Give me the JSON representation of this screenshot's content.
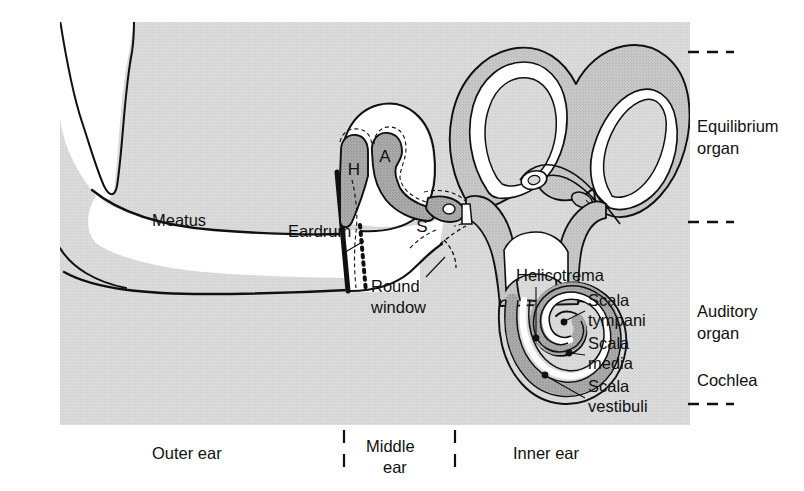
{
  "figure": {
    "background_color": "#ffffff",
    "panel_color": "#d9d9d9",
    "tissue_dark_color": "#a8a8a8",
    "tissue_mid_color": "#c4c4c4",
    "lumen_color": "#ffffff",
    "outline_color": "#101010"
  },
  "labels": {
    "meatus": "Meatus",
    "eardrum": "Eardrum",
    "round_window_line1": "Round",
    "round_window_line2": "window",
    "helicotrema": "Helicotrema",
    "scala_tympani_line1": "Scala",
    "scala_tympani_line2": "tympani",
    "scala_media_line1": "Scala",
    "scala_media_line2": "media",
    "scala_vestibuli_line1": "Scala",
    "scala_vestibuli_line2": "vestibuli",
    "ossicle_hammer": "H",
    "ossicle_anvil": "A",
    "ossicle_stirrup": "S"
  },
  "right_brackets": {
    "equilibrium_line1": "Equilibrium",
    "equilibrium_line2": "organ",
    "auditory_line1": "Auditory",
    "auditory_line2": "organ",
    "cochlea": "Cochlea"
  },
  "bottom_regions": {
    "outer": "Outer ear",
    "middle_line1": "Middle",
    "middle_line2": "ear",
    "inner": "Inner ear"
  }
}
